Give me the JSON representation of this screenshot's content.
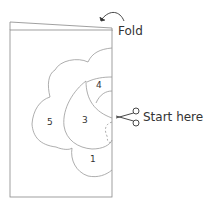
{
  "diagram": {
    "labels": {
      "fold": "Fold",
      "start": "Start here."
    },
    "petals": [
      {
        "id": "petal-1",
        "number": "1"
      },
      {
        "id": "petal-3",
        "number": "3"
      },
      {
        "id": "petal-4",
        "number": "4"
      },
      {
        "id": "petal-5",
        "number": "5"
      }
    ],
    "icons": {
      "fold_arrow": "curved-arrow-icon",
      "scissors": "scissors-icon"
    },
    "colors": {
      "line": "#888888",
      "text": "#333333",
      "background": "#ffffff"
    }
  }
}
